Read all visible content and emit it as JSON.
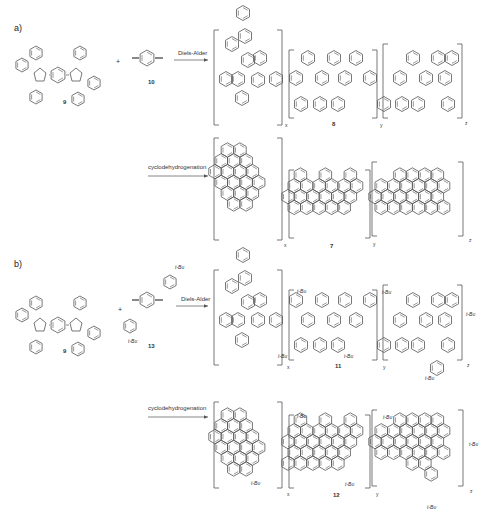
{
  "panels": [
    {
      "label": "a)",
      "reactants": [
        {
          "id": "9",
          "label": "9",
          "type": "bis(tetraphenylcyclopentadienone)"
        },
        {
          "id": "10",
          "label": "10",
          "type": "1,4-diethynylbenzene"
        }
      ],
      "plus": "+",
      "step1": {
        "arrow_label": "Diels-Alder",
        "product_label": "8"
      },
      "step2": {
        "arrow_label": "cyclodehydrogenation",
        "product_label": "7"
      },
      "repeat_units": [
        "x",
        "y",
        "z"
      ]
    },
    {
      "label": "b)",
      "reactants": [
        {
          "id": "9",
          "label": "9",
          "type": "bis(tetraphenylcyclopentadienone)"
        },
        {
          "id": "13",
          "label": "13",
          "type": "tBu-substituted diethynylterphenyl",
          "substituents": [
            "t-Bu",
            "t-Bu"
          ]
        }
      ],
      "plus": "+",
      "step1": {
        "arrow_label": "Diels-Alder",
        "product_label": "11"
      },
      "step2": {
        "arrow_label": "cyclodehydrogenation",
        "product_label": "12"
      },
      "repeat_units": [
        "x",
        "y",
        "z"
      ],
      "substituent_label": "t-Bu"
    }
  ]
}
